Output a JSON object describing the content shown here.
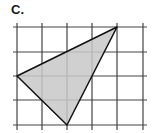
{
  "label": "C.",
  "grid": {
    "x_lines": [
      17,
      42,
      67,
      92,
      117,
      143
    ],
    "y_lines": [
      27,
      52,
      76,
      100,
      125
    ],
    "x_extent": [
      13,
      147
    ],
    "y_extent": [
      23,
      130
    ],
    "color": "#444444"
  },
  "triangle": {
    "vertices": [
      [
        117,
        27
      ],
      [
        17,
        76
      ],
      [
        67,
        125
      ]
    ],
    "vertices_grid": [
      [
        4,
        0
      ],
      [
        0,
        2
      ],
      [
        2,
        4
      ]
    ],
    "fill": "#c8c8c8",
    "stroke": "#111111"
  }
}
